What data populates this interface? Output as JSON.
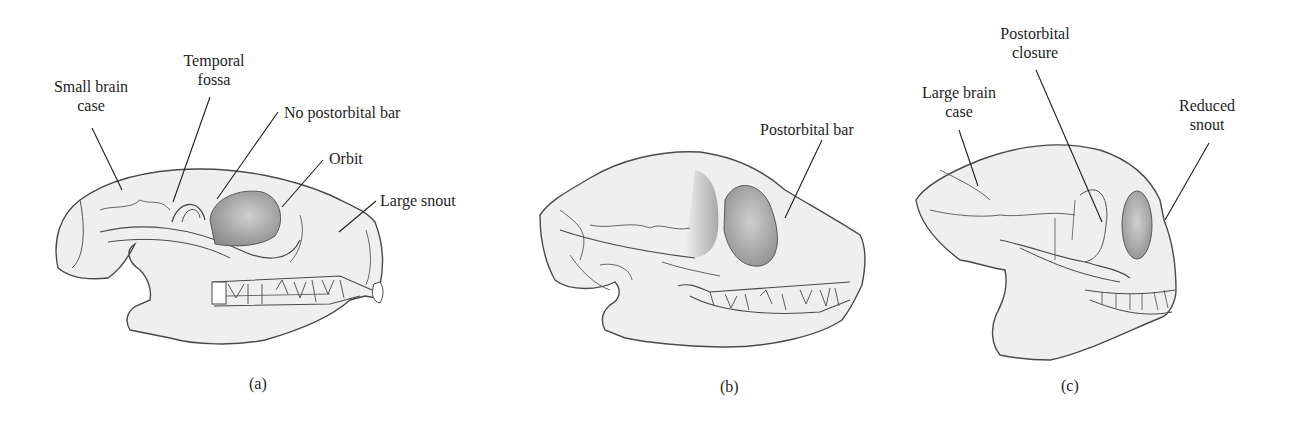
{
  "figure": {
    "background": "#ffffff",
    "skull_fill": "#efefef",
    "outline_color": "#4a4a4a",
    "orbit_shade": "#a8a8a8",
    "panels": [
      {
        "id": "a",
        "caption": "(a)",
        "labels": {
          "small_brain_case": [
            "Small brain",
            "case"
          ],
          "temporal_fossa": [
            "Temporal",
            "fossa"
          ],
          "no_postorbital_bar": "No postorbital bar",
          "orbit": "Orbit",
          "large_snout": "Large snout"
        }
      },
      {
        "id": "b",
        "caption": "(b)",
        "labels": {
          "postorbital_bar": "Postorbital bar"
        }
      },
      {
        "id": "c",
        "caption": "(c)",
        "labels": {
          "postorbital_closure": [
            "Postorbital",
            "closure"
          ],
          "large_brain_case": [
            "Large brain",
            "case"
          ],
          "reduced_snout": [
            "Reduced",
            "snout"
          ]
        }
      }
    ]
  }
}
